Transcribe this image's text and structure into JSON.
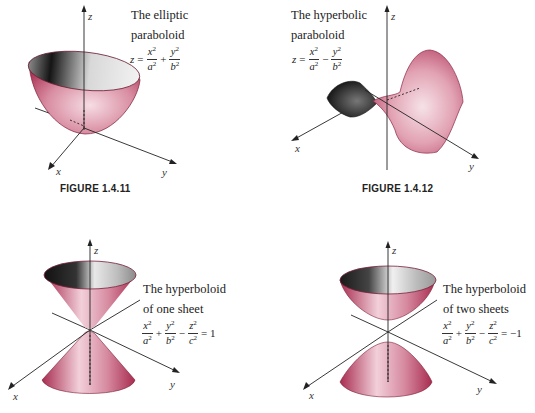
{
  "figures": [
    {
      "id": "fig-1-4-11",
      "caption": "FIGURE 1.4.11",
      "title_line1": "The elliptic",
      "title_line2": "paraboloid",
      "equation": {
        "lhs": "z",
        "op1": "=",
        "t1_num": "x",
        "t1_den": "a",
        "op2": "+",
        "t2_num": "y",
        "t2_den": "b",
        "exp": "2"
      },
      "axes": {
        "z": "z",
        "x": "x",
        "y": "y"
      }
    },
    {
      "id": "fig-1-4-12",
      "caption": "FIGURE 1.4.12",
      "title_line1": "The hyperbolic",
      "title_line2": "paraboloid",
      "equation": {
        "lhs": "z",
        "op1": "=",
        "t1_num": "x",
        "t1_den": "a",
        "op2": "−",
        "t2_num": "y",
        "t2_den": "b",
        "exp": "2"
      },
      "axes": {
        "z": "z",
        "x": "x",
        "y": "y"
      }
    },
    {
      "id": "hyperboloid-one-sheet",
      "title_line1": "The hyperboloid",
      "title_line2": "of one sheet",
      "equation": {
        "t1_num": "x",
        "t1_den": "a",
        "op1": "+",
        "t2_num": "y",
        "t2_den": "b",
        "op2": "−",
        "t3_num": "z",
        "t3_den": "c",
        "rhs": "= 1",
        "exp": "2"
      },
      "axes": {
        "z": "z",
        "x": "x",
        "y": "y"
      }
    },
    {
      "id": "hyperboloid-two-sheets",
      "title_line1": "The hyperboloid",
      "title_line2": "of two sheets",
      "equation": {
        "t1_num": "x",
        "t1_den": "a",
        "op1": "+",
        "t2_num": "y",
        "t2_den": "b",
        "op2": "−",
        "t3_num": "z",
        "t3_den": "c",
        "rhs": "= −1",
        "exp": "2"
      },
      "axes": {
        "z": "z",
        "x": "x",
        "y": "y"
      }
    }
  ],
  "colors": {
    "surface_red": "#b8385a",
    "surface_light": "#f3d6de",
    "interior_dark": "#2a2a2a",
    "axis": "#222222"
  }
}
